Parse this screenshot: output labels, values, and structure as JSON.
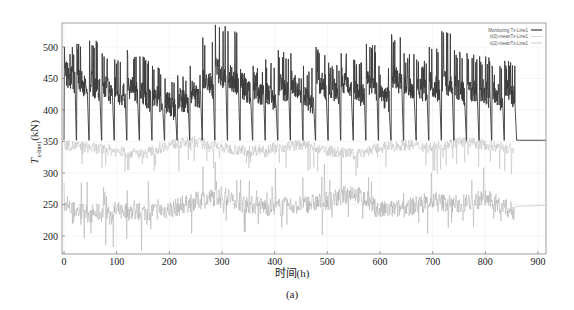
{
  "chart_data": {
    "type": "line",
    "title": "",
    "xlabel": "时间(h)",
    "ylabel": "T_x-line1 (kN)",
    "ylabel_main": "T",
    "ylabel_sub": "x-line1",
    "ylabel_unit": "(kN)",
    "caption": "(a)",
    "xlim": [
      0,
      915
    ],
    "ylim": [
      175,
      535
    ],
    "xticks": [
      0,
      100,
      200,
      300,
      400,
      500,
      600,
      700,
      800,
      900
    ],
    "yticks": [
      200,
      250,
      300,
      350,
      400,
      450,
      500
    ],
    "grid": true,
    "legend_position": "upper right",
    "legend": [
      {
        "name": "Monitoring Tx-Line1",
        "color": "#3a3a3a",
        "width": 1.2
      },
      {
        "name": "ti(0)-meanTx-Line1",
        "color": "#bdbdbd",
        "width": 0.6
      },
      {
        "name": "ti(2)-meanTx-Line1",
        "color": "#a8a8a8",
        "width": 0.6
      }
    ],
    "series": [
      {
        "name": "Monitoring Tx-Line1",
        "description": "Periodic sawtooth: rises to ~430-530 kN peaks, oscillates ~400-490, drops to ~352 kN roughly every 24 h; after ~865 h constant at ~352 kN",
        "cycle_period_h": 24,
        "cycle_start_h": 0,
        "cycle_end_h": 860,
        "baseline_kN": 352,
        "flat_after_h": 865,
        "flat_value_kN": 352,
        "cycle_peaks_kN": [
          500,
          505,
          510,
          490,
          480,
          495,
          485,
          470,
          450,
          455,
          470,
          515,
          535,
          525,
          465,
          470,
          480,
          495,
          490,
          470,
          500,
          475,
          490,
          480,
          505,
          470,
          520,
          490,
          480,
          500,
          525,
          495,
          490,
          485,
          470,
          478
        ],
        "cycle_means_kN": [
          460,
          450,
          445,
          440,
          435,
          440,
          430,
          425,
          415,
          420,
          430,
          450,
          465,
          455,
          440,
          435,
          430,
          440,
          445,
          425,
          450,
          440,
          450,
          435,
          445,
          430,
          455,
          445,
          440,
          445,
          450,
          440,
          440,
          435,
          430,
          435
        ]
      },
      {
        "name": "ti(0)-meanTx-Line1",
        "description": "Light gray noisy line around ~335-355 kN, range ~300-365; ends ~855 h",
        "x_range": [
          0,
          855
        ],
        "mean_kN": 340,
        "amplitude_kN": 18,
        "sample_x": [
          0,
          50,
          100,
          150,
          200,
          250,
          300,
          350,
          400,
          450,
          500,
          550,
          600,
          650,
          700,
          750,
          800,
          850
        ],
        "sample_y": [
          345,
          340,
          335,
          330,
          345,
          350,
          340,
          335,
          340,
          345,
          335,
          330,
          340,
          345,
          340,
          350,
          345,
          338
        ]
      },
      {
        "name": "ti(2)-meanTx-Line1",
        "description": "Gray noisy line around ~245 kN, range ~190-320; after ~855 h smooth ~248 kN to end",
        "x_range": [
          0,
          915
        ],
        "mean_kN": 245,
        "amplitude_kN": 30,
        "sample_x": [
          0,
          50,
          100,
          150,
          200,
          250,
          300,
          350,
          400,
          450,
          500,
          550,
          600,
          650,
          700,
          750,
          800,
          850,
          900,
          915
        ],
        "sample_y": [
          245,
          235,
          240,
          238,
          242,
          255,
          265,
          250,
          245,
          250,
          255,
          270,
          240,
          245,
          255,
          250,
          260,
          240,
          248,
          248
        ]
      }
    ]
  }
}
